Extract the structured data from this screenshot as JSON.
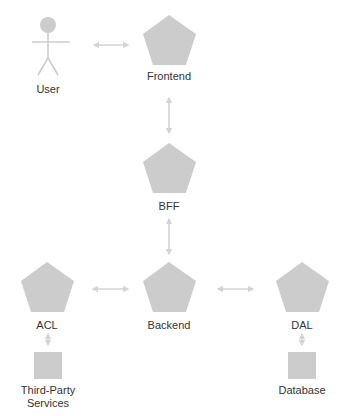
{
  "colors": {
    "shape_fill": "#cccccc",
    "arrow": "#d4d4d4",
    "text": "#333333"
  },
  "nodes": {
    "user": {
      "label": "User",
      "shape": "actor"
    },
    "frontend": {
      "label": "Frontend",
      "shape": "pentagon"
    },
    "bff": {
      "label": "BFF",
      "shape": "pentagon"
    },
    "acl": {
      "label": "ACL",
      "shape": "pentagon"
    },
    "backend": {
      "label": "Backend",
      "shape": "pentagon"
    },
    "dal": {
      "label": "DAL",
      "shape": "pentagon"
    },
    "third_party": {
      "label_line1": "Third-Party",
      "label_line2": "Services",
      "shape": "square"
    },
    "database": {
      "label": "Database",
      "shape": "square"
    }
  },
  "edges": [
    {
      "from": "user",
      "to": "frontend",
      "type": "bidirectional"
    },
    {
      "from": "frontend",
      "to": "bff",
      "type": "bidirectional"
    },
    {
      "from": "bff",
      "to": "backend",
      "type": "bidirectional"
    },
    {
      "from": "acl",
      "to": "backend",
      "type": "bidirectional"
    },
    {
      "from": "backend",
      "to": "dal",
      "type": "bidirectional"
    },
    {
      "from": "acl",
      "to": "third_party",
      "type": "bidirectional"
    },
    {
      "from": "dal",
      "to": "database",
      "type": "bidirectional"
    }
  ]
}
